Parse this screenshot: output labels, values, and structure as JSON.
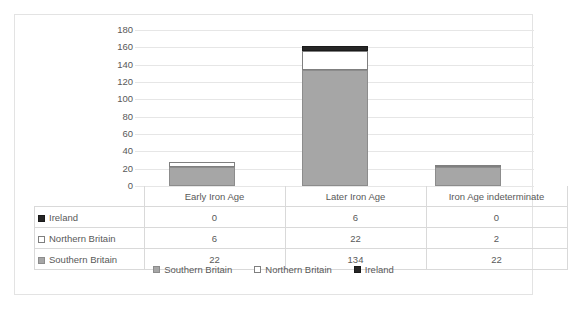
{
  "chart_data": {
    "type": "bar",
    "subtype": "stacked-column",
    "title": "",
    "xlabel": "",
    "ylabel": "",
    "ylim": [
      0,
      180
    ],
    "ytick_step": 20,
    "yticks": [
      180,
      160,
      140,
      120,
      100,
      80,
      60,
      40,
      20,
      0
    ],
    "grid": true,
    "legend_position": "bottom",
    "categories": [
      "Early Iron Age",
      "Later Iron Age",
      "Iron Age indeterminate"
    ],
    "series": [
      {
        "name": "Southern Britain",
        "values": [
          22,
          134,
          22
        ],
        "color": "#a6a6a6",
        "marker": "filled-gray"
      },
      {
        "name": "Northern Britain",
        "values": [
          6,
          22,
          2
        ],
        "color": "#ffffff",
        "marker": "outlined-white"
      },
      {
        "name": "Ireland",
        "values": [
          0,
          6,
          0
        ],
        "color": "#262626",
        "marker": "filled-black"
      }
    ],
    "stack_order_bottom_to_top": [
      "Southern Britain",
      "Northern Britain",
      "Ireland"
    ],
    "totals": [
      28,
      162,
      24
    ]
  },
  "table": {
    "corner_label": "",
    "column_headers": [
      "Early Iron Age",
      "Later Iron Age",
      "Iron Age indeterminate"
    ],
    "rows": [
      {
        "label": "Ireland",
        "marker": "filled-black",
        "values": [
          "0",
          "6",
          "0"
        ]
      },
      {
        "label": "Northern Britain",
        "marker": "outlined-white",
        "values": [
          "6",
          "22",
          "2"
        ]
      },
      {
        "label": "Southern Britain",
        "marker": "filled-gray",
        "values": [
          "22",
          "134",
          "22"
        ]
      }
    ]
  },
  "legend": {
    "items": [
      {
        "label": "Southern Britain",
        "marker": "filled-gray"
      },
      {
        "label": "Northern Britain",
        "marker": "outlined-white"
      },
      {
        "label": "Ireland",
        "marker": "filled-black"
      }
    ]
  },
  "colors": {
    "southern_britain": "#a6a6a6",
    "northern_britain": "#ffffff",
    "ireland": "#262626",
    "gridline": "#e6e6e6",
    "text": "#595959",
    "border": "#e3e3e3",
    "table_border": "#d9d9d9"
  }
}
